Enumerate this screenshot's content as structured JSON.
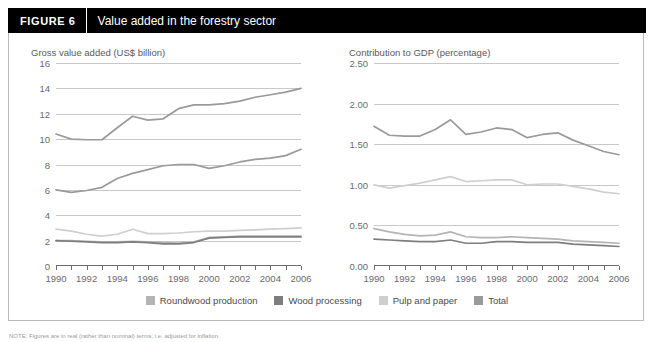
{
  "header": {
    "figure_tag": "FIGURE  6",
    "title": "Value added in the forestry sector"
  },
  "legend": {
    "items": [
      {
        "label": "Roundwood production",
        "color": "#b4b4b4"
      },
      {
        "label": "Wood processing",
        "color": "#7e7e7e"
      },
      {
        "label": "Pulp and paper",
        "color": "#cfcfcf"
      },
      {
        "label": "Total",
        "color": "#9a9a9a"
      }
    ]
  },
  "note": "NOTE: Figures are in real (rather than nominal) terms, i.e. adjusted for inflation.",
  "chart_data": [
    {
      "type": "line",
      "id": "gross-value-added",
      "title": "Gross value added (US$ billion)",
      "xlabel": "",
      "ylabel": "Gross value added (US$ billion)",
      "x": [
        1990,
        1991,
        1992,
        1993,
        1994,
        1995,
        1996,
        1997,
        1998,
        1999,
        2000,
        2001,
        2002,
        2003,
        2004,
        2005,
        2006
      ],
      "xticklabels": [
        "1990",
        "",
        "1992",
        "",
        "1994",
        "",
        "1996",
        "",
        "1998",
        "",
        "2000",
        "",
        "2002",
        "",
        "2004",
        "",
        "2006"
      ],
      "yticks": [
        0,
        2,
        4,
        6,
        8,
        10,
        12,
        14,
        16
      ],
      "ylim": [
        0,
        16
      ],
      "xlim": [
        1990,
        2006
      ],
      "grid": true,
      "legend_position": "bottom",
      "series": [
        {
          "name": "Roundwood production",
          "color": "#b4b4b4",
          "values": [
            2.0,
            2.0,
            1.95,
            1.9,
            1.9,
            1.95,
            1.9,
            1.85,
            1.8,
            1.9,
            2.25,
            2.3,
            2.35,
            2.35,
            2.35,
            2.35,
            2.35
          ]
        },
        {
          "name": "Wood processing",
          "color": "#7e7e7e",
          "values": [
            2.0,
            1.95,
            1.9,
            1.85,
            1.85,
            1.9,
            1.85,
            1.75,
            1.75,
            1.85,
            2.2,
            2.25,
            2.3,
            2.3,
            2.3,
            2.3,
            2.3
          ]
        },
        {
          "name": "Pulp and paper",
          "color": "#cfcfcf",
          "values": [
            2.9,
            2.75,
            2.5,
            2.35,
            2.5,
            2.9,
            2.55,
            2.55,
            2.6,
            2.7,
            2.75,
            2.75,
            2.8,
            2.85,
            2.9,
            2.95,
            3.0
          ]
        },
        {
          "name": "Total",
          "color": "#9a9a9a",
          "values": [
            10.4,
            10.0,
            9.95,
            9.95,
            10.9,
            11.8,
            11.5,
            11.6,
            12.4,
            12.7,
            12.7,
            12.8,
            13.0,
            13.3,
            13.5,
            13.7,
            14.0
          ]
        }
      ],
      "extra_series": [
        {
          "name": "mid-band",
          "color": "#9a9a9a",
          "values": [
            6.0,
            5.8,
            5.95,
            6.2,
            6.9,
            7.3,
            7.6,
            7.9,
            8.0,
            8.0,
            7.7,
            7.9,
            8.2,
            8.4,
            8.5,
            8.7,
            9.2
          ]
        }
      ]
    },
    {
      "type": "line",
      "id": "contribution-to-gdp",
      "title": "Contribution to GDP (percentage)",
      "xlabel": "",
      "ylabel": "Contribution to GDP (percentage)",
      "x": [
        1990,
        1991,
        1992,
        1993,
        1994,
        1995,
        1996,
        1997,
        1998,
        1999,
        2000,
        2001,
        2002,
        2003,
        2004,
        2005,
        2006
      ],
      "xticklabels": [
        "1990",
        "",
        "1992",
        "",
        "1994",
        "",
        "1996",
        "",
        "1998",
        "",
        "2000",
        "",
        "2002",
        "",
        "2004",
        "",
        "2006"
      ],
      "yticks": [
        "0.00",
        "0.50",
        "1.00",
        "1.50",
        "2.00",
        "2.50"
      ],
      "ylim": [
        0,
        2.5
      ],
      "xlim": [
        1990,
        2006
      ],
      "grid": true,
      "legend_position": "bottom",
      "series": [
        {
          "name": "Roundwood production",
          "color": "#b4b4b4",
          "values": [
            0.46,
            0.42,
            0.39,
            0.37,
            0.38,
            0.42,
            0.36,
            0.35,
            0.35,
            0.36,
            0.35,
            0.34,
            0.33,
            0.31,
            0.3,
            0.29,
            0.28
          ]
        },
        {
          "name": "Wood processing",
          "color": "#7e7e7e",
          "values": [
            0.33,
            0.32,
            0.31,
            0.3,
            0.3,
            0.32,
            0.28,
            0.28,
            0.3,
            0.3,
            0.29,
            0.29,
            0.29,
            0.27,
            0.26,
            0.25,
            0.24
          ]
        },
        {
          "name": "Pulp and paper",
          "color": "#cfcfcf",
          "values": [
            1.0,
            0.96,
            0.99,
            1.02,
            1.06,
            1.1,
            1.04,
            1.05,
            1.06,
            1.06,
            1.0,
            1.01,
            1.01,
            0.98,
            0.95,
            0.91,
            0.89
          ]
        },
        {
          "name": "Total",
          "color": "#9a9a9a",
          "values": [
            1.72,
            1.61,
            1.6,
            1.6,
            1.68,
            1.8,
            1.62,
            1.65,
            1.7,
            1.68,
            1.58,
            1.62,
            1.64,
            1.55,
            1.48,
            1.41,
            1.37
          ]
        }
      ],
      "extra_series": []
    }
  ]
}
